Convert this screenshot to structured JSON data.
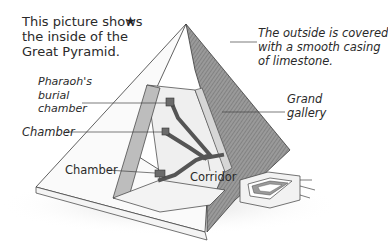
{
  "diagram": {
    "intro": {
      "lines": [
        "This picture shows",
        "the inside of the",
        "Great Pyramid."
      ],
      "marker": "★"
    },
    "labels": {
      "outside_note": {
        "lines": [
          "The outside is covered",
          "with a smooth casing",
          "of limestone."
        ]
      },
      "pharaohs_chamber": {
        "lines": [
          "Pharaoh's",
          "burial",
          "chamber"
        ]
      },
      "chamber_middle": "Chamber",
      "grand_gallery": {
        "lines": [
          "Grand",
          "gallery"
        ]
      },
      "chamber_lower": "Chamber",
      "corridor": "Corridor"
    },
    "colors": {
      "outline": "#3a3a3a",
      "casing_shade": "#8a8a8a",
      "interior_wall": "#bdbdbd",
      "interior_floor": "#f1f1f1",
      "passage": "#5a5a5a",
      "text": "#2a2a2a"
    }
  }
}
